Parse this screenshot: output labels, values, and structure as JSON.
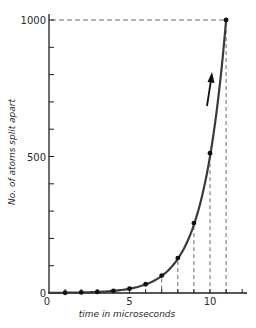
{
  "chart_data": {
    "type": "line",
    "title": "",
    "xlabel": "time in microseconds",
    "ylabel": "No. of atoms split apart",
    "x": [
      1,
      2,
      3,
      4,
      5,
      6,
      7,
      8,
      9,
      10,
      11
    ],
    "series": [
      {
        "name": "atoms split",
        "values": [
          1,
          2,
          4,
          8,
          16,
          32,
          64,
          128,
          256,
          512,
          1000
        ]
      }
    ],
    "xlim": [
      0,
      12.3
    ],
    "ylim": [
      0,
      1000
    ],
    "x_ticks": [
      0,
      5,
      10
    ],
    "x_tick_labels": [
      "0",
      "5",
      "10"
    ],
    "y_ticks": [
      0,
      500,
      1000
    ],
    "y_tick_labels": [
      "0",
      "500",
      "1000"
    ],
    "y_minor_tick_step": 100,
    "x_minor_tick_step": 1,
    "grid": false,
    "legend": "none",
    "annotations": [
      {
        "type": "dashed-drop-lines",
        "x": [
          7,
          8,
          9,
          10,
          11
        ]
      },
      {
        "type": "dashed-horizontal",
        "y": 1000,
        "from_x": 0,
        "to_x": 11
      },
      {
        "type": "arrow",
        "direction": "up",
        "near_x": 10,
        "description": "upward arrow indicating rapid growth"
      }
    ]
  },
  "colors": {
    "curve": "#3a3a3a",
    "axis": "#1e1e1e",
    "dash": "#6a6a6a",
    "point": "#111111"
  }
}
